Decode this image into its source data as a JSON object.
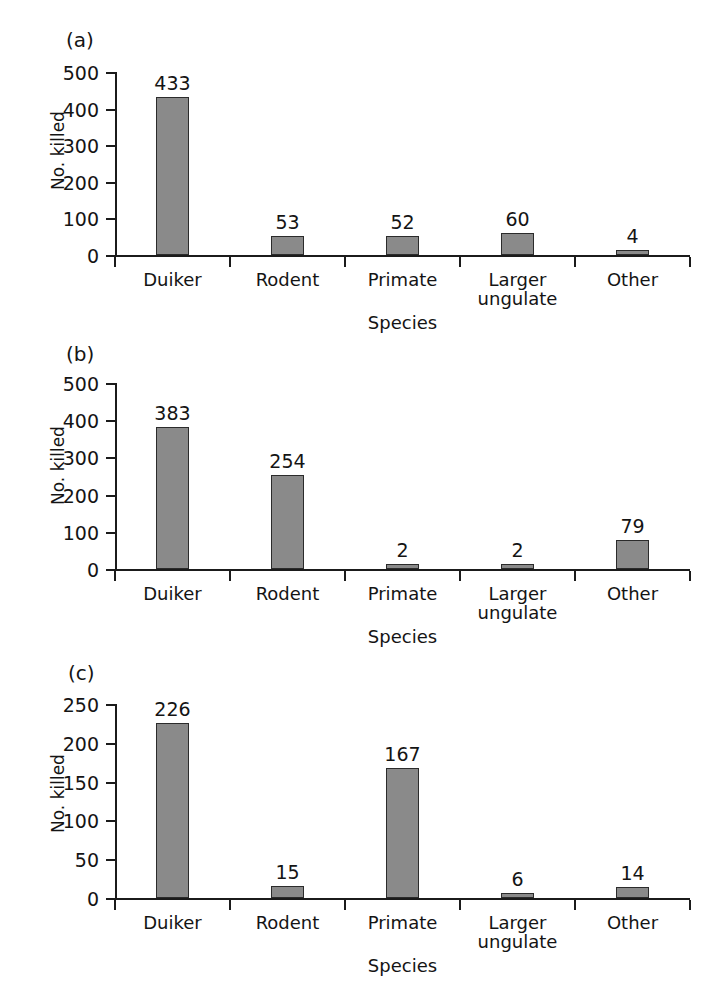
{
  "figure": {
    "panels": [
      {
        "tag": "(a)",
        "ylabel": "No. killed",
        "xlabel": "Species",
        "ticks": [
          "0",
          "100",
          "200",
          "300",
          "400",
          "500"
        ],
        "categories": [
          {
            "line1": "Duiker",
            "line2": ""
          },
          {
            "line1": "Rodent",
            "line2": ""
          },
          {
            "line1": "Primate",
            "line2": ""
          },
          {
            "line1": "Larger",
            "line2": "ungulate"
          },
          {
            "line1": "Other",
            "line2": ""
          }
        ],
        "values": [
          "433",
          "53",
          "52",
          "60",
          "4"
        ]
      },
      {
        "tag": "(b)",
        "ylabel": "No. killed",
        "xlabel": "Species",
        "ticks": [
          "0",
          "100",
          "200",
          "300",
          "400",
          "500"
        ],
        "categories": [
          {
            "line1": "Duiker",
            "line2": ""
          },
          {
            "line1": "Rodent",
            "line2": ""
          },
          {
            "line1": "Primate",
            "line2": ""
          },
          {
            "line1": "Larger",
            "line2": "ungulate"
          },
          {
            "line1": "Other",
            "line2": ""
          }
        ],
        "values": [
          "383",
          "254",
          "2",
          "2",
          "79"
        ]
      },
      {
        "tag": "(c)",
        "ylabel": "No. killed",
        "xlabel": "Species",
        "ticks": [
          "0",
          "50",
          "100",
          "150",
          "200",
          "250"
        ],
        "categories": [
          {
            "line1": "Duiker",
            "line2": ""
          },
          {
            "line1": "Rodent",
            "line2": ""
          },
          {
            "line1": "Primate",
            "line2": ""
          },
          {
            "line1": "Larger",
            "line2": "ungulate"
          },
          {
            "line1": "Other",
            "line2": ""
          }
        ],
        "values": [
          "226",
          "15",
          "167",
          "6",
          "14"
        ]
      }
    ],
    "bar_color": "#8a8a8a",
    "axis_color": "#1b1b1b"
  },
  "chart_data": [
    {
      "type": "bar",
      "panel": "(a)",
      "title": "",
      "xlabel": "Species",
      "ylabel": "No. killed",
      "categories": [
        "Duiker",
        "Rodent",
        "Primate",
        "Larger ungulate",
        "Other"
      ],
      "values": [
        433,
        53,
        52,
        60,
        4
      ],
      "ylim": [
        0,
        500
      ],
      "ytick_step": 100,
      "yticks": [
        0,
        100,
        200,
        300,
        400,
        500
      ],
      "grid": false,
      "legend": "none",
      "data_labels": true
    },
    {
      "type": "bar",
      "panel": "(b)",
      "title": "",
      "xlabel": "Species",
      "ylabel": "No. killed",
      "categories": [
        "Duiker",
        "Rodent",
        "Primate",
        "Larger ungulate",
        "Other"
      ],
      "values": [
        383,
        254,
        2,
        2,
        79
      ],
      "ylim": [
        0,
        500
      ],
      "ytick_step": 100,
      "yticks": [
        0,
        100,
        200,
        300,
        400,
        500
      ],
      "grid": false,
      "legend": "none",
      "data_labels": true
    },
    {
      "type": "bar",
      "panel": "(c)",
      "title": "",
      "xlabel": "Species",
      "ylabel": "No. killed",
      "categories": [
        "Duiker",
        "Rodent",
        "Primate",
        "Larger ungulate",
        "Other"
      ],
      "values": [
        226,
        15,
        167,
        6,
        14
      ],
      "ylim": [
        0,
        250
      ],
      "ytick_step": 50,
      "yticks": [
        0,
        50,
        100,
        150,
        200,
        250
      ],
      "grid": false,
      "legend": "none",
      "data_labels": true
    }
  ]
}
